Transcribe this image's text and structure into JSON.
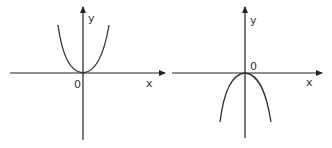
{
  "graphs": [
    {
      "name": "upward-parabola-graph",
      "y_label": "y",
      "x_label": "x",
      "origin_label": "0",
      "shape": "opens upward, vertex at origin"
    },
    {
      "name": "downward-parabola-graph",
      "y_label": "y",
      "x_label": "x",
      "origin_label": "0",
      "shape": "opens downward, vertex at origin"
    }
  ]
}
